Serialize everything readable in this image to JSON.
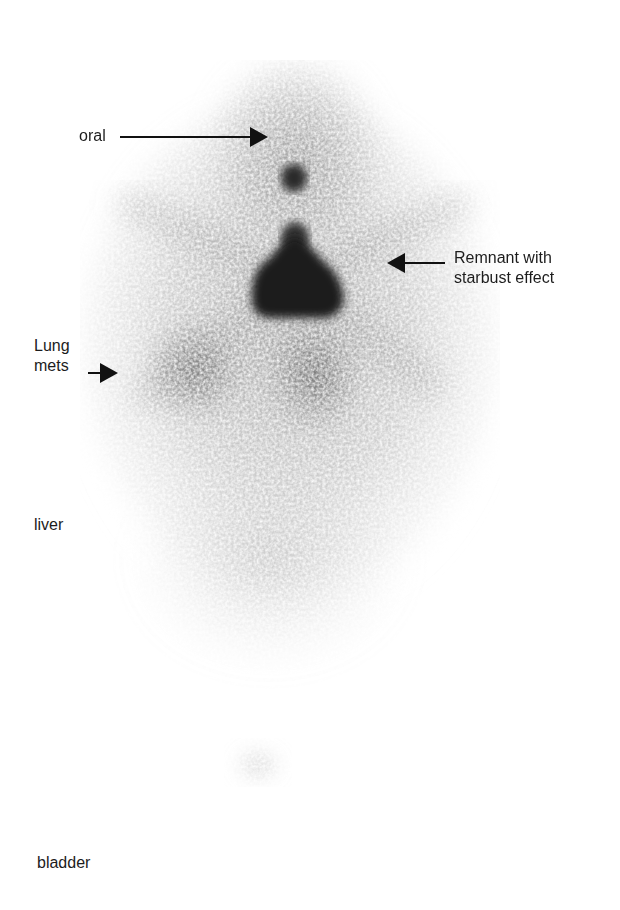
{
  "figure": {
    "type": "whole-body nuclear scan (anterior view)",
    "background": "#ffffff",
    "annotations": [
      {
        "id": "oral",
        "label": "oral",
        "arrow_direction": "right"
      },
      {
        "id": "remnant",
        "label": "Remnant with\nstarbust effect",
        "arrow_direction": "left"
      },
      {
        "id": "lung",
        "label": "Lung\nmets",
        "arrow_direction": "right"
      },
      {
        "id": "liver",
        "label": "liver",
        "arrow_direction": "none"
      },
      {
        "id": "bladder",
        "label": "bladder",
        "arrow_direction": "none"
      }
    ],
    "uptake_regions": [
      {
        "name": "oral",
        "intensity": "high"
      },
      {
        "name": "thyroid remnant",
        "intensity": "very high"
      },
      {
        "name": "lung metastases (left)",
        "intensity": "moderate"
      },
      {
        "name": "lung metastases (right)",
        "intensity": "moderate"
      },
      {
        "name": "liver",
        "intensity": "low"
      },
      {
        "name": "bladder",
        "intensity": "faint"
      }
    ]
  }
}
